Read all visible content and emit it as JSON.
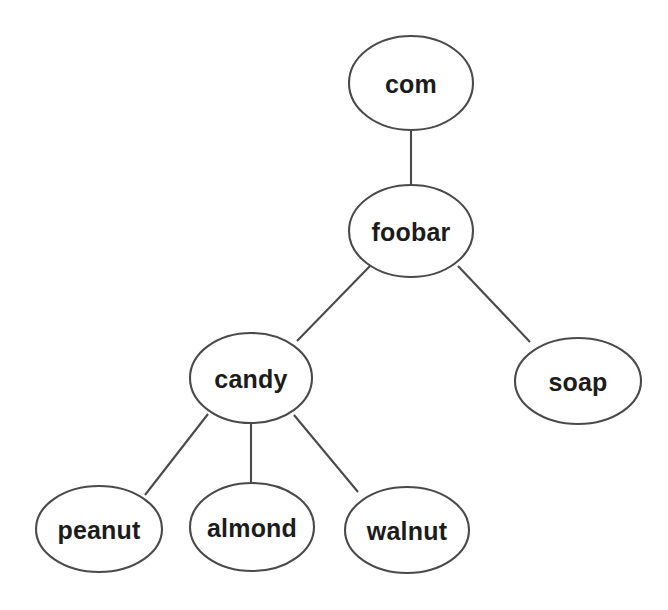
{
  "diagram": {
    "type": "tree",
    "title": "",
    "background_color": "#ffffff",
    "node_fill_color": "#ffffff",
    "node_stroke_color": "#4a4a4a",
    "edge_color": "#4a4a4a",
    "label_color": "#1c1c1c",
    "nodes": [
      {
        "id": "com",
        "label": "com",
        "cx": 411,
        "cy": 83,
        "rx": 62,
        "ry": 47
      },
      {
        "id": "foobar",
        "label": "foobar",
        "cx": 411,
        "cy": 231,
        "rx": 62,
        "ry": 46
      },
      {
        "id": "candy",
        "label": "candy",
        "cx": 251,
        "cy": 378,
        "rx": 61,
        "ry": 45
      },
      {
        "id": "soap",
        "label": "soap",
        "cx": 578,
        "cy": 381,
        "rx": 63,
        "ry": 43
      },
      {
        "id": "peanut",
        "label": "peanut",
        "cx": 99,
        "cy": 529,
        "rx": 63,
        "ry": 43
      },
      {
        "id": "almond",
        "label": "almond",
        "cx": 252,
        "cy": 527,
        "rx": 62,
        "ry": 44
      },
      {
        "id": "walnut",
        "label": "walnut",
        "cx": 407,
        "cy": 530,
        "rx": 62,
        "ry": 43
      }
    ],
    "edges": [
      {
        "from": "com",
        "to": "foobar",
        "x1": 411,
        "y1": 130,
        "x2": 411,
        "y2": 185
      },
      {
        "from": "foobar",
        "to": "candy",
        "x1": 370,
        "y1": 266,
        "x2": 297,
        "y2": 341
      },
      {
        "from": "foobar",
        "to": "soap",
        "x1": 458,
        "y1": 266,
        "x2": 530,
        "y2": 342
      },
      {
        "from": "candy",
        "to": "peanut",
        "x1": 208,
        "y1": 414,
        "x2": 145,
        "y2": 495
      },
      {
        "from": "candy",
        "to": "almond",
        "x1": 251,
        "y1": 423,
        "x2": 251,
        "y2": 483
      },
      {
        "from": "candy",
        "to": "walnut",
        "x1": 294,
        "y1": 415,
        "x2": 358,
        "y2": 492
      }
    ]
  }
}
